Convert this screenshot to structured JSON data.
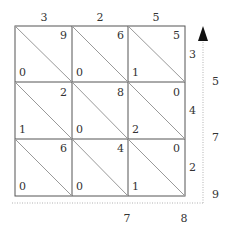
{
  "diagram": {
    "type": "lattice-multiplication",
    "top_digits": [
      "3",
      "2",
      "5"
    ],
    "right_digits": [
      "3",
      "4",
      "2"
    ],
    "cells": [
      [
        {
          "tens": "0",
          "ones": "9"
        },
        {
          "tens": "0",
          "ones": "6"
        },
        {
          "tens": "1",
          "ones": "5"
        }
      ],
      [
        {
          "tens": "1",
          "ones": "2"
        },
        {
          "tens": "0",
          "ones": "8"
        },
        {
          "tens": "2",
          "ones": "0"
        }
      ],
      [
        {
          "tens": "0",
          "ones": "6"
        },
        {
          "tens": "0",
          "ones": "4"
        },
        {
          "tens": "1",
          "ones": "0"
        }
      ]
    ],
    "result_right": [
      "5",
      "7",
      "9"
    ],
    "result_bottom": [
      "7",
      "8"
    ],
    "colors": {
      "grid": "#555555",
      "diagonal": "#888888",
      "dotted": "#cccccc",
      "arrow": "#111111"
    }
  }
}
